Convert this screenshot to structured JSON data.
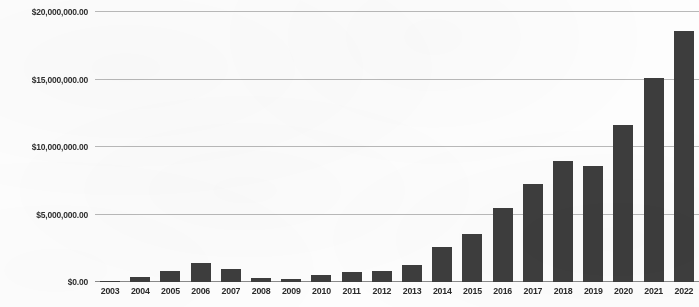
{
  "chart_data": {
    "type": "bar",
    "title": "",
    "xlabel": "",
    "ylabel": "",
    "ylim": [
      0,
      20000000
    ],
    "grid": true,
    "legend": "none",
    "y_ticks": [
      0,
      5000000,
      10000000,
      15000000,
      20000000
    ],
    "y_tick_labels": [
      "$0.00",
      "$5,000,000.00",
      "$10,000,000.00",
      "$15,000,000.00",
      "$20,000,000.00"
    ],
    "categories": [
      "2003",
      "2004",
      "2005",
      "2006",
      "2007",
      "2008",
      "2009",
      "2010",
      "2011",
      "2012",
      "2013",
      "2014",
      "2015",
      "2016",
      "2017",
      "2018",
      "2019",
      "2020",
      "2021",
      "2022"
    ],
    "values": [
      70000,
      360000,
      790000,
      1430000,
      930000,
      290000,
      210000,
      500000,
      720000,
      820000,
      1290000,
      2570000,
      3570000,
      5500000,
      7290000,
      8930000,
      8570000,
      11640000,
      15140000,
      18570000
    ],
    "bar_color": "#3d3d3d",
    "gridline_color": "#b9b9b9",
    "axis_color": "#8a8a8a",
    "background_color": "#fdfdfd"
  }
}
